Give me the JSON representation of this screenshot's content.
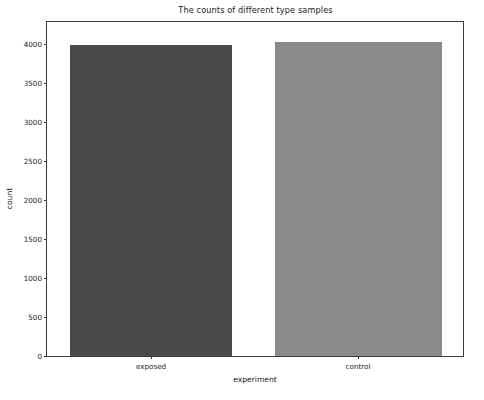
{
  "chart_data": {
    "type": "bar",
    "title": "The counts of different type samples",
    "xlabel": "experiment",
    "ylabel": "count",
    "categories": [
      "exposed",
      "control"
    ],
    "values": [
      3985,
      4025
    ],
    "series": [
      {
        "name": "count",
        "values": [
          3985,
          4025
        ]
      }
    ],
    "bar_colors": [
      "#4a4a4d",
      "#8a8a8d"
    ],
    "ylim": [
      0,
      4286
    ],
    "yticks": [
      0,
      500,
      1000,
      1500,
      2000,
      2500,
      3000,
      3500,
      4000
    ],
    "ytick_labels": [
      "0",
      "500",
      "1000",
      "1500",
      "2000",
      "2500",
      "3000",
      "3500",
      "4000"
    ],
    "xtick_labels": [
      "exposed",
      "control"
    ],
    "grid": false,
    "legend": null,
    "background_color": "#ffffff",
    "axes_color": "#3a3a3a"
  }
}
